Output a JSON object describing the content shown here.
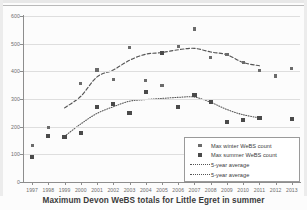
{
  "caption": "Maximum Devon WeBS totals for Little Egret in summer",
  "legend": {
    "items": [
      {
        "label": "Max winter WeBS count",
        "marker": "square-small",
        "color": "#6b6b6b"
      },
      {
        "label": "Max summer WeBS count",
        "marker": "square-large",
        "color": "#4a4a4a"
      },
      {
        "label": "5-year average",
        "marker": "dashed-line",
        "color": "#555555"
      },
      {
        "label": "5-year average",
        "marker": "dotted-line",
        "color": "#555555"
      }
    ]
  },
  "chart_data": {
    "type": "scatter",
    "title": "Maximum Devon WeBS totals for Little Egret in summer",
    "xlabel": "",
    "ylabel": "",
    "xlim": [
      1996.5,
      2013.5
    ],
    "ylim": [
      0,
      600
    ],
    "yticks": [
      0,
      100,
      200,
      300,
      400,
      500,
      600
    ],
    "grid": true,
    "legend_position": "bottom-right",
    "categories": [
      1997,
      1998,
      1999,
      2000,
      2001,
      2002,
      2003,
      2004,
      2005,
      2006,
      2007,
      2008,
      2009,
      2010,
      2011,
      2012,
      2013
    ],
    "xticklabels": [
      "1997",
      "1998",
      "1999",
      "2000",
      "2001",
      "2002",
      "2003",
      "2004",
      "2005",
      "2006",
      "2007",
      "2008",
      "2009",
      "2010",
      "2011",
      "2012",
      "2013"
    ],
    "series": [
      {
        "name": "Max winter WeBS count",
        "kind": "scatter",
        "marker": "square-small",
        "color": "#6b6b6b",
        "x": [
          1997,
          1998,
          1999,
          2000,
          2001,
          2002,
          2003,
          2004,
          2005,
          2006,
          2007,
          2008,
          2009,
          2010,
          2011,
          2012,
          2013
        ],
        "values": [
          133,
          196,
          164,
          356,
          405,
          370,
          487,
          367,
          349,
          490,
          553,
          451,
          462,
          433,
          402,
          383,
          411
        ]
      },
      {
        "name": "Max summer WeBS count",
        "kind": "scatter",
        "marker": "square-large",
        "color": "#4a4a4a",
        "x": [
          1997,
          1998,
          1999,
          2000,
          2001,
          2002,
          2003,
          2004,
          2005,
          2006,
          2007,
          2008,
          2009,
          2010,
          2011,
          2013
        ],
        "values": [
          90,
          165,
          163,
          176,
          270,
          282,
          249,
          324,
          466,
          270,
          314,
          288,
          217,
          225,
          230,
          227
        ]
      },
      {
        "name": "5-year average",
        "kind": "line",
        "style": "dashed",
        "color": "#555555",
        "x": [
          1999,
          2000,
          2001,
          2002,
          2003,
          2004,
          2005,
          2006,
          2007,
          2008,
          2009,
          2010,
          2011
        ],
        "values": [
          268,
          310,
          380,
          405,
          440,
          462,
          468,
          478,
          483,
          470,
          460,
          432,
          420
        ]
      },
      {
        "name": "5-year average",
        "kind": "line",
        "style": "dotted",
        "color": "#555555",
        "x": [
          1999,
          2000,
          2001,
          2002,
          2003,
          2004,
          2005,
          2006,
          2007,
          2008,
          2009,
          2010,
          2011
        ],
        "values": [
          165,
          210,
          248,
          272,
          292,
          298,
          302,
          306,
          307,
          288,
          262,
          243,
          232
        ]
      }
    ]
  }
}
